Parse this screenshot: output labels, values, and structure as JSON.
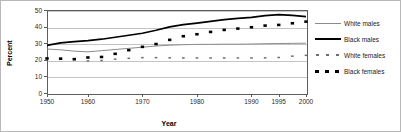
{
  "chart_data": {
    "type": "line",
    "title": "",
    "xlabel": "Year",
    "ylabel": "Percent",
    "ylim": [
      0,
      50
    ],
    "yticks": [
      0,
      10,
      20,
      30,
      40,
      50
    ],
    "grid": true,
    "legend_position": "right",
    "x": [
      1950,
      1955,
      1958,
      1960,
      1962,
      1965,
      1968,
      1970,
      1972,
      1975,
      1978,
      1980,
      1983,
      1986,
      1988,
      1990,
      1993,
      1995,
      1997,
      2000
    ],
    "xtick_labels": [
      "1950",
      "1960",
      "1970",
      "1980",
      "1990",
      "1995",
      "2000"
    ],
    "xtick_values": [
      1950,
      1960,
      1970,
      1980,
      1990,
      1995,
      2000
    ],
    "series": [
      {
        "name": "White males",
        "style": "thin-gray-line",
        "color": "#8c8c8c",
        "values": [
          26.5,
          26.0,
          25.2,
          24.8,
          25.5,
          26.2,
          26.9,
          27.6,
          28.3,
          28.8,
          29.1,
          29.3,
          29.3,
          29.4,
          29.4,
          29.5,
          29.7,
          29.8,
          29.9,
          30.0
        ]
      },
      {
        "name": "Black males",
        "style": "thick-black-line",
        "color": "#000000",
        "values": [
          28.7,
          30.2,
          31.0,
          31.6,
          32.4,
          33.6,
          34.8,
          36.0,
          37.8,
          39.8,
          41.2,
          42.1,
          43.1,
          44.2,
          45.0,
          45.6,
          46.6,
          47.2,
          46.8,
          46.0
        ]
      },
      {
        "name": "White females",
        "style": "small-dashed",
        "color": "#6e6e6e",
        "values": [
          20.8,
          20.6,
          20.1,
          19.3,
          19.6,
          20.4,
          20.9,
          21.3,
          21.3,
          21.2,
          21.1,
          21.1,
          21.1,
          21.1,
          21.1,
          21.1,
          21.2,
          21.4,
          22.2,
          22.7
        ]
      },
      {
        "name": "Black females",
        "style": "thick-dashed",
        "color": "#000000",
        "values": [
          20.8,
          20.7,
          20.4,
          21.4,
          21.7,
          23.6,
          25.8,
          27.8,
          29.5,
          32.0,
          34.2,
          35.4,
          36.8,
          38.0,
          38.8,
          39.6,
          40.6,
          41.0,
          42.0,
          43.0
        ]
      }
    ]
  },
  "legend": {
    "items": [
      {
        "label": "White males"
      },
      {
        "label": "Black males"
      },
      {
        "label": "White females"
      },
      {
        "label": "Black females"
      }
    ]
  }
}
